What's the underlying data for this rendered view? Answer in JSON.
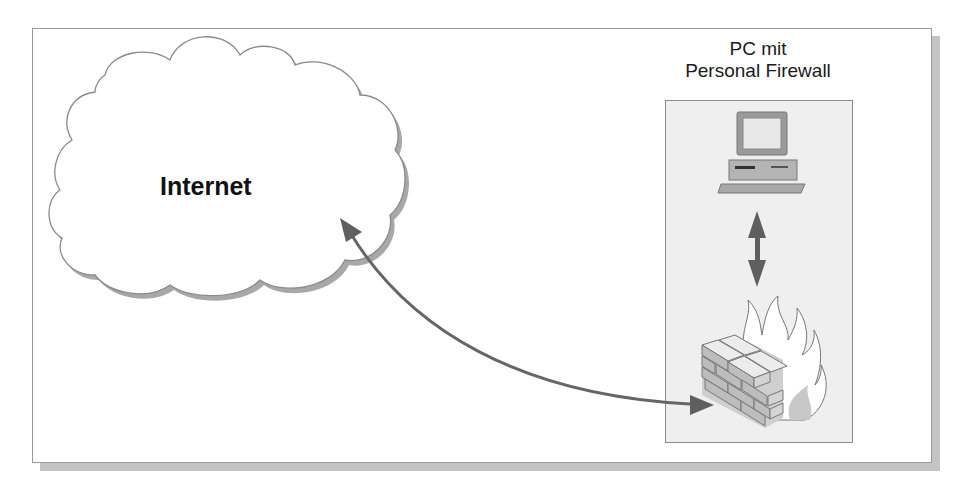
{
  "diagram": {
    "cloud": {
      "label": "Internet",
      "icon": "cloud-icon"
    },
    "host": {
      "title_line1": "PC mit",
      "title_line2": "Personal Firewall",
      "computer_icon": "computer-icon",
      "firewall_icon": "firewall-icon"
    },
    "connections": [
      {
        "from": "Internet",
        "to": "Personal Firewall",
        "type": "bidirectional-curved-arrow"
      },
      {
        "from": "PC",
        "to": "Personal Firewall",
        "type": "bidirectional-vertical-arrow"
      }
    ],
    "colors": {
      "arrow": "#666666",
      "panel_bg": "#efefef",
      "frame_shadow": "#c4c4c4",
      "cloud_shadow": "#a8a8a8"
    }
  }
}
